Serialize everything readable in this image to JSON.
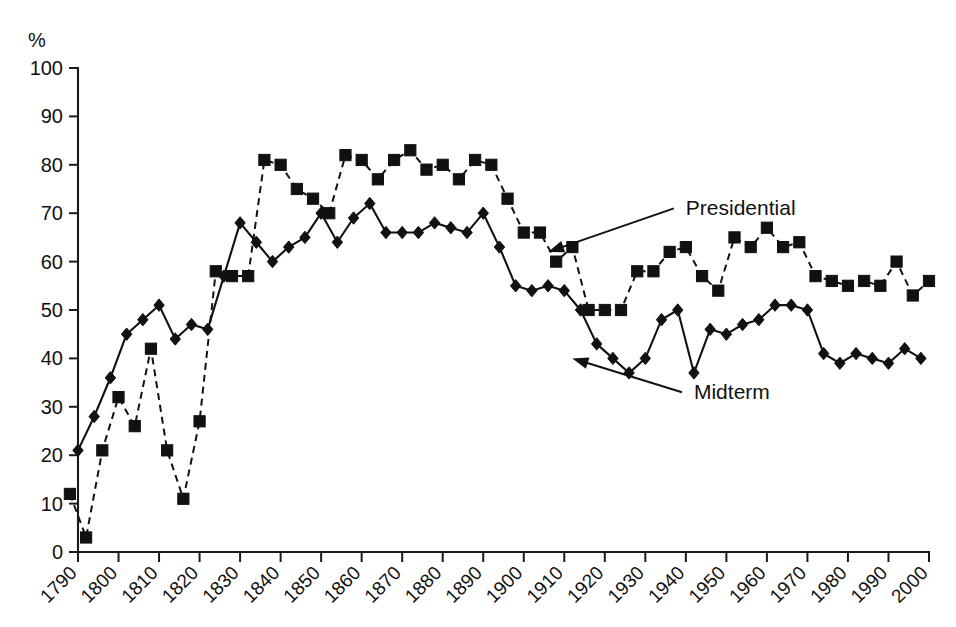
{
  "chart_data": {
    "type": "line",
    "title": "",
    "subtitle": "",
    "xlabel": "",
    "ylabel": "%",
    "unit_label": "%",
    "xlim": [
      1788,
      2002
    ],
    "ylim": [
      0,
      100
    ],
    "grid": false,
    "legend_position": "inline-annotations",
    "ytick_labels": [
      "0",
      "10",
      "20",
      "30",
      "40",
      "50",
      "60",
      "70",
      "80",
      "90",
      "100"
    ],
    "ytick_values": [
      0,
      10,
      20,
      30,
      40,
      50,
      60,
      70,
      80,
      90,
      100
    ],
    "xtick_labels": [
      "1790",
      "1800",
      "1810",
      "1820",
      "1830",
      "1840",
      "1850",
      "1860",
      "1870",
      "1880",
      "1890",
      "1900",
      "1910",
      "1920",
      "1930",
      "1940",
      "1950",
      "1960",
      "1970",
      "1980",
      "1990",
      "2000"
    ],
    "xtick_values": [
      1790,
      1800,
      1810,
      1820,
      1830,
      1840,
      1850,
      1860,
      1870,
      1880,
      1890,
      1900,
      1910,
      1920,
      1930,
      1940,
      1950,
      1960,
      1970,
      1980,
      1990,
      2000
    ],
    "annotations": [
      {
        "label": "Presidential",
        "text_x": 1940,
        "text_y": 71,
        "point_x": 1906,
        "point_y": 62
      },
      {
        "label": "Midterm",
        "text_x": 1942,
        "text_y": 33,
        "point_x": 1912,
        "point_y": 40
      }
    ],
    "series": [
      {
        "name": "Presidential",
        "marker": "square",
        "linestyle": "dashed",
        "color": "#111111",
        "x": [
          1788,
          1792,
          1796,
          1800,
          1804,
          1808,
          1812,
          1816,
          1820,
          1824,
          1828,
          1832,
          1836,
          1840,
          1844,
          1848,
          1852,
          1856,
          1860,
          1864,
          1868,
          1872,
          1876,
          1880,
          1884,
          1888,
          1892,
          1896,
          1900,
          1904,
          1908,
          1912,
          1916,
          1920,
          1924,
          1928,
          1932,
          1936,
          1940,
          1944,
          1948,
          1952,
          1956,
          1960,
          1964,
          1968,
          1972,
          1976,
          1980,
          1984,
          1988,
          1992,
          1996,
          2000
        ],
        "values": [
          12,
          3,
          21,
          32,
          26,
          42,
          21,
          11,
          27,
          58,
          57,
          57,
          81,
          80,
          75,
          73,
          70,
          82,
          81,
          77,
          81,
          83,
          79,
          80,
          77,
          81,
          80,
          73,
          66,
          66,
          60,
          63,
          50,
          50,
          50,
          58,
          58,
          62,
          63,
          57,
          54,
          65,
          63,
          67,
          63,
          64,
          57,
          56,
          55,
          56,
          55,
          60,
          53,
          56
        ]
      },
      {
        "name": "Midterm",
        "marker": "diamond",
        "linestyle": "solid",
        "color": "#111111",
        "x": [
          1790,
          1794,
          1798,
          1802,
          1806,
          1810,
          1814,
          1818,
          1822,
          1826,
          1830,
          1834,
          1838,
          1842,
          1846,
          1850,
          1854,
          1858,
          1862,
          1866,
          1870,
          1874,
          1878,
          1882,
          1886,
          1890,
          1894,
          1898,
          1902,
          1906,
          1910,
          1914,
          1918,
          1922,
          1926,
          1930,
          1934,
          1938,
          1942,
          1946,
          1950,
          1954,
          1958,
          1962,
          1966,
          1970,
          1974,
          1978,
          1982,
          1986,
          1990,
          1994,
          1998
        ],
        "values": [
          21,
          28,
          36,
          45,
          48,
          51,
          44,
          47,
          46,
          57,
          68,
          64,
          60,
          63,
          65,
          70,
          64,
          69,
          72,
          66,
          66,
          66,
          68,
          67,
          66,
          70,
          63,
          55,
          54,
          55,
          54,
          50,
          43,
          40,
          37,
          40,
          48,
          50,
          37,
          46,
          45,
          47,
          48,
          51,
          51,
          50,
          41,
          39,
          41,
          40,
          39,
          42,
          40
        ]
      }
    ]
  },
  "axis": {
    "unit": "%",
    "y_title": "%"
  }
}
